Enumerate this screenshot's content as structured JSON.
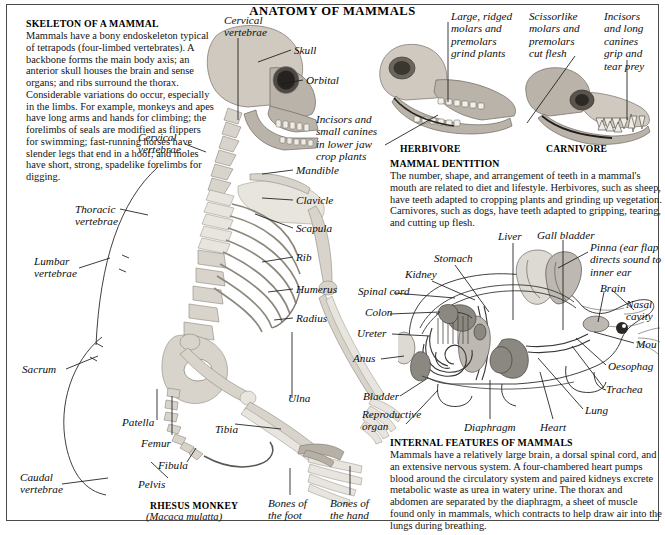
{
  "page": {
    "title": "ANATOMY OF MAMMALS"
  },
  "skeleton_panel": {
    "heading": "SKELETON OF A MAMMAL",
    "body": "Mammals have a bony endoskeleton typical of tetrapods (four-limbed vertebrates). A backbone forms the main body axis; an anterior skull houses the brain and sense organs; and ribs surround the thorax. Considerable variations do occur, especially in the limbs. For example, monkeys and apes have long arms and hands for climbing; the forelimbs of seals are modified as flippers for swimming; fast-running horses have slender legs that end in a hoof; and moles have short, strong, spadelike forelimbs for digging.",
    "specimen_name": "RHESUS MONKEY",
    "specimen_latin": "(Macaca mulatta)",
    "labels": {
      "cervical_top": "Cervical\nvertebrae",
      "cervical_mid": "Cervical\nvertebrae",
      "thoracic": "Thoracic\nvertebrae",
      "lumbar": "Lumbar\nvertebrae",
      "sacrum": "Sacrum",
      "caudal": "Caudal\nvertebrae",
      "patella": "Patella",
      "femur": "Femur",
      "fibula": "Fibula",
      "pelvis": "Pelvis",
      "tibia": "Tibia",
      "ulna": "Ulna",
      "skull": "Skull",
      "orbital": "Orbital",
      "mandible": "Mandible",
      "clavicle": "Clavicle",
      "scapula": "Scapula",
      "rib": "Rib",
      "humerus": "Humerus",
      "radius": "Radius",
      "bones_foot": "Bones of\nthe foot",
      "bones_hand": "Bones of\nthe hand"
    }
  },
  "dentition_panel": {
    "heading": "MAMMAL DENTITION",
    "body": "The number, shape, and arrangement of teeth in a mammal's mouth are related to diet and lifestyle. Herbivores, such as sheep, have teeth adapted to cropping plants and grinding up vegetation. Carnivores, such as dogs, have teeth adapted to gripping, tearing, and cutting up flesh.",
    "herbivore_caption": "HERBIVORE",
    "carnivore_caption": "CARNIVORE",
    "labels": {
      "herb_molars": "Large, ridged\nmolars and\npremolars\ngrind plants",
      "herb_incisors": "Incisors and\nsmall canines\nin lower jaw\ncrop plants",
      "carn_molars": "Scissorlike\nmolars and\npremolars\ncut flesh",
      "carn_incisors": "Incisors\nand long\ncanines\ngrip and\ntear prey"
    }
  },
  "internal_panel": {
    "heading": "INTERNAL FEATURES OF MAMMALS",
    "body": "Mammals have a relatively large brain, a dorsal spinal cord, and an extensive nervous system. A four-chambered heart pumps blood around the circulatory system and paired kidneys excrete metabolic waste as urea in watery urine. The thorax and abdomen are separated by the diaphragm, a sheet of muscle found only in mammals, which contracts to help draw air into the lungs during breathing.",
    "labels": {
      "liver": "Liver",
      "gall_bladder": "Gall bladder",
      "pinna": "Pinna (ear flap\ndirects sound to\ninner ear",
      "stomach": "Stomach",
      "kidney": "Kidney",
      "spinal_cord": "Spinal cord",
      "colon": "Colon",
      "ureter": "Ureter",
      "anus": "Anus",
      "bladder": "Bladder",
      "reproductive_organ": "Reproductive\norgan",
      "diaphragm": "Diaphragm",
      "heart": "Heart",
      "lung": "Lung",
      "trachea": "Trachea",
      "oesophagus": "Oesophag",
      "mouth": "Mou",
      "nasal_cavity": "Nasal\ncavity",
      "brain": "Brain"
    }
  },
  "colors": {
    "ink": "#101010",
    "rule": "#4a4a4a",
    "bone": "#d8d4cc",
    "organ": "#bdb8b1"
  }
}
